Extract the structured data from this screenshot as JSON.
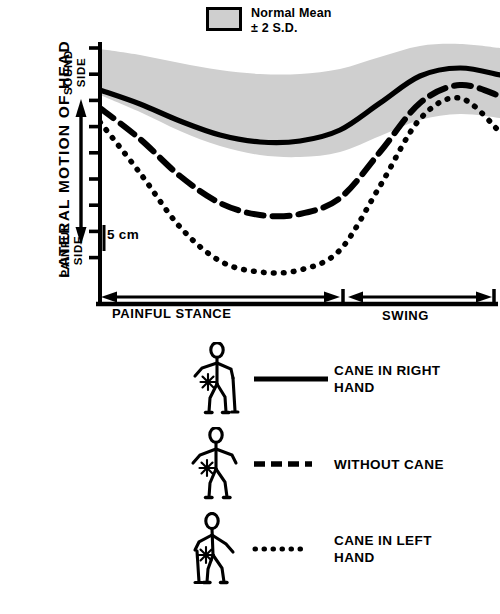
{
  "figure": {
    "y_axis_title": "LATERAL  MOTION  OF  HEAD",
    "y_top_label": "SOUND\nSIDE",
    "y_bottom_label": "PAINFUL\nSIDE",
    "scale_label": "5 cm"
  },
  "legend_top": {
    "line1": "Normal Mean",
    "line2": "± 2 S.D.",
    "swatch_color": "#cfcfcf",
    "swatch_name": "normal-range-swatch"
  },
  "x_axis": {
    "segments": [
      {
        "label": "PAINFUL   STANCE",
        "name": "painful-stance"
      },
      {
        "label": "SWING",
        "name": "swing"
      }
    ]
  },
  "series_legend": [
    {
      "label": "CANE IN RIGHT\nHAND",
      "style": "solid",
      "figure_icon": "stick-figure-cane-right"
    },
    {
      "label": "WITHOUT CANE",
      "style": "dashed",
      "figure_icon": "stick-figure-no-cane"
    },
    {
      "label": "CANE IN LEFT\nHAND",
      "style": "dotted",
      "figure_icon": "stick-figure-cane-left"
    }
  ],
  "chart_data": {
    "type": "line",
    "xlabel": "Gait cycle (painful stance / swing)",
    "ylabel": "LATERAL MOTION OF HEAD",
    "grid": false,
    "legend_position": "below",
    "y_direction": "up = sound side, down = painful side",
    "y_tick_interval_cm": 5,
    "y_tick_count": 9,
    "x": [
      0,
      10,
      20,
      30,
      40,
      50,
      60,
      70,
      80,
      90,
      100
    ],
    "x_event_split_percent": 62,
    "band": {
      "name": "Normal Mean ± 2 S.D.",
      "color": "#cfcfcf",
      "upper": [
        49,
        55,
        63,
        70,
        74,
        74,
        69,
        57,
        46,
        44,
        48
      ],
      "lower": [
        95,
        112,
        131,
        146,
        155,
        157,
        152,
        136,
        120,
        114,
        118
      ]
    },
    "series": [
      {
        "name": "CANE IN RIGHT HAND",
        "style": "solid",
        "values": [
          90,
          104,
          121,
          135,
          142,
          141,
          130,
          103,
          76,
          68,
          75
        ]
      },
      {
        "name": "WITHOUT CANE",
        "style": "dashed",
        "values": [
          108,
          139,
          176,
          203,
          215,
          214,
          198,
          152,
          103,
          85,
          96
        ]
      },
      {
        "name": "CANE IN LEFT HAND",
        "style": "dotted",
        "values": [
          122,
          173,
          227,
          261,
          272,
          270,
          250,
          186,
          119,
          98,
          132
        ]
      }
    ]
  }
}
